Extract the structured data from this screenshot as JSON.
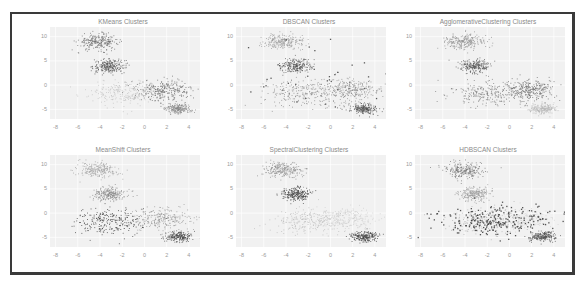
{
  "figure": {
    "frame_border_color": "#3a3a3a"
  },
  "chart_data": [
    {
      "type": "scatter",
      "title": "KMeans Clusters",
      "xlabel": "",
      "ylabel": "",
      "xticks": [
        -8,
        -6,
        -4,
        -2,
        0,
        2,
        4
      ],
      "yticks": [
        10,
        5,
        0,
        -5
      ],
      "xlim": [
        -8.5,
        5
      ],
      "ylim": [
        -7,
        12
      ],
      "grid": true,
      "clusters": [
        {
          "center": [
            -4.2,
            9
          ],
          "spread": [
            0.9,
            0.8
          ],
          "n": 260,
          "shade": "#6e6e6e"
        },
        {
          "center": [
            -3.2,
            4
          ],
          "spread": [
            0.7,
            0.7
          ],
          "n": 240,
          "shade": "#555555"
        },
        {
          "center": [
            -2.0,
            -1.5
          ],
          "spread": [
            1.6,
            1.3
          ],
          "n": 220,
          "shade": "#c4c4c4"
        },
        {
          "center": [
            1.8,
            -1.0
          ],
          "spread": [
            1.2,
            1.1
          ],
          "n": 280,
          "shade": "#6a6a6a"
        },
        {
          "center": [
            3.0,
            -4.8
          ],
          "spread": [
            0.6,
            0.5
          ],
          "n": 220,
          "shade": "#8a8a8a"
        }
      ]
    },
    {
      "type": "scatter",
      "title": "DBSCAN Clusters",
      "xlabel": "",
      "ylabel": "",
      "xticks": [
        -8,
        -6,
        -4,
        -2,
        0,
        2,
        4
      ],
      "yticks": [
        10,
        5,
        0,
        -5
      ],
      "xlim": [
        -8.5,
        5
      ],
      "ylim": [
        -7,
        12
      ],
      "grid": true,
      "clusters": [
        {
          "center": [
            -4.2,
            9
          ],
          "spread": [
            0.9,
            0.8
          ],
          "n": 240,
          "shade": "#9a9a9a"
        },
        {
          "center": [
            -3.2,
            4
          ],
          "spread": [
            0.7,
            0.7
          ],
          "n": 240,
          "shade": "#5a5a5a"
        },
        {
          "center": [
            -2.0,
            -1.5
          ],
          "spread": [
            2.0,
            1.3
          ],
          "n": 280,
          "shade": "#8c8c8c"
        },
        {
          "center": [
            1.8,
            -1.0
          ],
          "spread": [
            1.3,
            1.1
          ],
          "n": 240,
          "shade": "#8c8c8c"
        },
        {
          "center": [
            3.0,
            -4.8
          ],
          "spread": [
            0.6,
            0.5
          ],
          "n": 220,
          "shade": "#555555"
        },
        {
          "center": [
            -1.5,
            2.0
          ],
          "spread": [
            4.0,
            4.5
          ],
          "n": 40,
          "shade": "#404040",
          "label": "noise"
        }
      ]
    },
    {
      "type": "scatter",
      "title": "AgglomerativeClustering Clusters",
      "xlabel": "",
      "ylabel": "",
      "xticks": [
        -8,
        -6,
        -4,
        -2,
        0,
        2,
        4
      ],
      "yticks": [
        10,
        5,
        0,
        -5
      ],
      "xlim": [
        -8.5,
        5
      ],
      "ylim": [
        -7,
        12
      ],
      "grid": true,
      "clusters": [
        {
          "center": [
            -4.2,
            9
          ],
          "spread": [
            0.9,
            0.8
          ],
          "n": 240,
          "shade": "#8e8e8e"
        },
        {
          "center": [
            -3.2,
            4
          ],
          "spread": [
            0.7,
            0.7
          ],
          "n": 240,
          "shade": "#5c5c5c"
        },
        {
          "center": [
            -2.0,
            -1.5
          ],
          "spread": [
            1.8,
            1.3
          ],
          "n": 240,
          "shade": "#7a7a7a"
        },
        {
          "center": [
            1.8,
            -1.0
          ],
          "spread": [
            1.2,
            1.1
          ],
          "n": 280,
          "shade": "#6a6a6a"
        },
        {
          "center": [
            3.0,
            -4.8
          ],
          "spread": [
            0.6,
            0.5
          ],
          "n": 220,
          "shade": "#b8b8b8"
        }
      ]
    },
    {
      "type": "scatter",
      "title": "MeanShift Clusters",
      "xlabel": "",
      "ylabel": "",
      "xticks": [
        -8,
        -6,
        -4,
        -2,
        0,
        2,
        4
      ],
      "yticks": [
        10,
        5,
        0,
        -5
      ],
      "xlim": [
        -8.5,
        5
      ],
      "ylim": [
        -7,
        12
      ],
      "grid": true,
      "clusters": [
        {
          "center": [
            -4.2,
            9
          ],
          "spread": [
            0.9,
            0.8
          ],
          "n": 240,
          "shade": "#a4a4a4"
        },
        {
          "center": [
            -3.2,
            4
          ],
          "spread": [
            0.7,
            0.7
          ],
          "n": 240,
          "shade": "#8a8a8a"
        },
        {
          "center": [
            -3.0,
            -1.8
          ],
          "spread": [
            1.6,
            1.4
          ],
          "n": 260,
          "shade": "#3c3c3c"
        },
        {
          "center": [
            1.5,
            -1.0
          ],
          "spread": [
            1.5,
            1.2
          ],
          "n": 260,
          "shade": "#9a9a9a"
        },
        {
          "center": [
            3.0,
            -4.8
          ],
          "spread": [
            0.6,
            0.5
          ],
          "n": 220,
          "shade": "#505050"
        }
      ]
    },
    {
      "type": "scatter",
      "title": "SpectralClustering Clusters",
      "xlabel": "",
      "ylabel": "",
      "xticks": [
        -8,
        -6,
        -4,
        -2,
        0,
        2,
        4
      ],
      "yticks": [
        10,
        5,
        0,
        -5
      ],
      "xlim": [
        -8.5,
        5
      ],
      "ylim": [
        -7,
        12
      ],
      "grid": true,
      "clusters": [
        {
          "center": [
            -4.2,
            9
          ],
          "spread": [
            0.9,
            0.8
          ],
          "n": 240,
          "shade": "#8e8e8e"
        },
        {
          "center": [
            -3.2,
            4
          ],
          "spread": [
            0.7,
            0.7
          ],
          "n": 240,
          "shade": "#444444"
        },
        {
          "center": [
            -2.0,
            -1.5
          ],
          "spread": [
            1.8,
            1.3
          ],
          "n": 240,
          "shade": "#bcbcbc"
        },
        {
          "center": [
            1.5,
            -1.0
          ],
          "spread": [
            1.4,
            1.1
          ],
          "n": 240,
          "shade": "#d0d0d0"
        },
        {
          "center": [
            3.0,
            -4.8
          ],
          "spread": [
            0.6,
            0.5
          ],
          "n": 220,
          "shade": "#454545"
        }
      ]
    },
    {
      "type": "scatter",
      "title": "HDBSCAN Clusters",
      "xlabel": "",
      "ylabel": "",
      "xticks": [
        -8,
        -6,
        -4,
        -2,
        0,
        2,
        4
      ],
      "yticks": [
        10,
        5,
        0,
        -5
      ],
      "xlim": [
        -8.5,
        5
      ],
      "ylim": [
        -7,
        12
      ],
      "grid": true,
      "clusters": [
        {
          "center": [
            -4.2,
            9
          ],
          "spread": [
            0.9,
            0.8
          ],
          "n": 240,
          "shade": "#777777"
        },
        {
          "center": [
            -3.2,
            4
          ],
          "spread": [
            0.7,
            0.7
          ],
          "n": 240,
          "shade": "#9c9c9c"
        },
        {
          "center": [
            -2.0,
            -1.5
          ],
          "spread": [
            1.8,
            1.3
          ],
          "n": 200,
          "shade": "#b0b0b0"
        },
        {
          "center": [
            1.5,
            -1.0
          ],
          "spread": [
            1.2,
            1.0
          ],
          "n": 180,
          "shade": "#d2d2d2"
        },
        {
          "center": [
            3.0,
            -4.8
          ],
          "spread": [
            0.6,
            0.5
          ],
          "n": 220,
          "shade": "#555555"
        },
        {
          "center": [
            -1.0,
            -1.5
          ],
          "spread": [
            3.0,
            1.6
          ],
          "n": 260,
          "shade": "#3a3a3a",
          "label": "noise"
        }
      ]
    }
  ],
  "layout": {
    "subplots": [
      {
        "left": 18,
        "top": 4
      },
      {
        "left": 204,
        "top": 4
      },
      {
        "left": 383,
        "top": 4
      },
      {
        "left": 18,
        "top": 132
      },
      {
        "left": 204,
        "top": 132
      },
      {
        "left": 383,
        "top": 132
      }
    ]
  }
}
